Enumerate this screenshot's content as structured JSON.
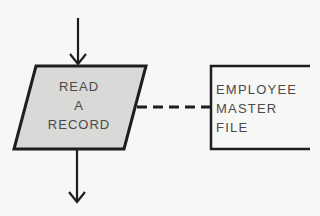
{
  "diagram": {
    "type": "flowchart",
    "colors": {
      "stroke": "#1e1e1e",
      "io_fill": "#d9d9d7",
      "text": "#4a4a4a",
      "background": "#f7f7f5"
    },
    "input_output": {
      "shape": "parallelogram",
      "lines": [
        "READ",
        "A",
        "RECORD"
      ]
    },
    "file_annotation": {
      "shape": "open-bracket",
      "lines": [
        "EMPLOYEE",
        "MASTER",
        "FILE"
      ]
    },
    "connectors": [
      {
        "from": "top",
        "to": "input_output",
        "style": "solid-arrow"
      },
      {
        "from": "input_output",
        "to": "bottom",
        "style": "solid-arrow"
      },
      {
        "from": "input_output",
        "to": "file_annotation",
        "style": "dashed"
      }
    ]
  }
}
